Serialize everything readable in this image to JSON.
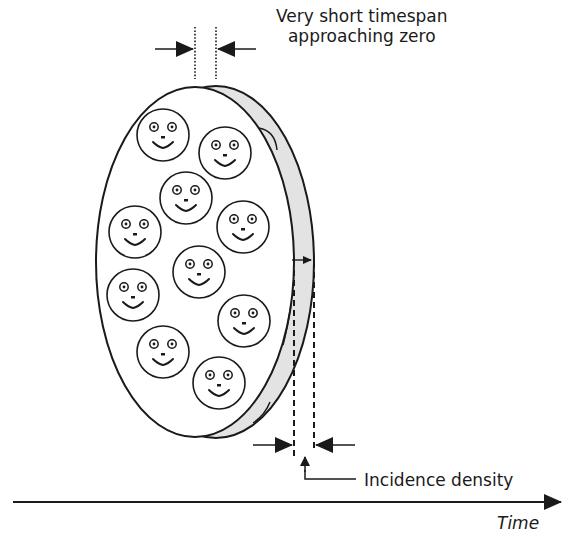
{
  "diagram": {
    "labels": {
      "timespan_line1": "Very short timespan",
      "timespan_line2": "approaching zero",
      "incidence": "Incidence density",
      "time_axis": "Time"
    },
    "colors": {
      "stroke": "#1a1a1a",
      "rim_fill": "#e3e3e3",
      "face_fill": "#ffffff"
    },
    "population": {
      "shape": "disc",
      "face_count": 10,
      "faces": [
        {
          "cx": 163,
          "cy": 135
        },
        {
          "cx": 225,
          "cy": 153
        },
        {
          "cx": 186,
          "cy": 198
        },
        {
          "cx": 135,
          "cy": 232
        },
        {
          "cx": 243,
          "cy": 227
        },
        {
          "cx": 199,
          "cy": 272
        },
        {
          "cx": 133,
          "cy": 295
        },
        {
          "cx": 244,
          "cy": 321
        },
        {
          "cx": 163,
          "cy": 352
        },
        {
          "cx": 219,
          "cy": 383
        }
      ]
    }
  }
}
